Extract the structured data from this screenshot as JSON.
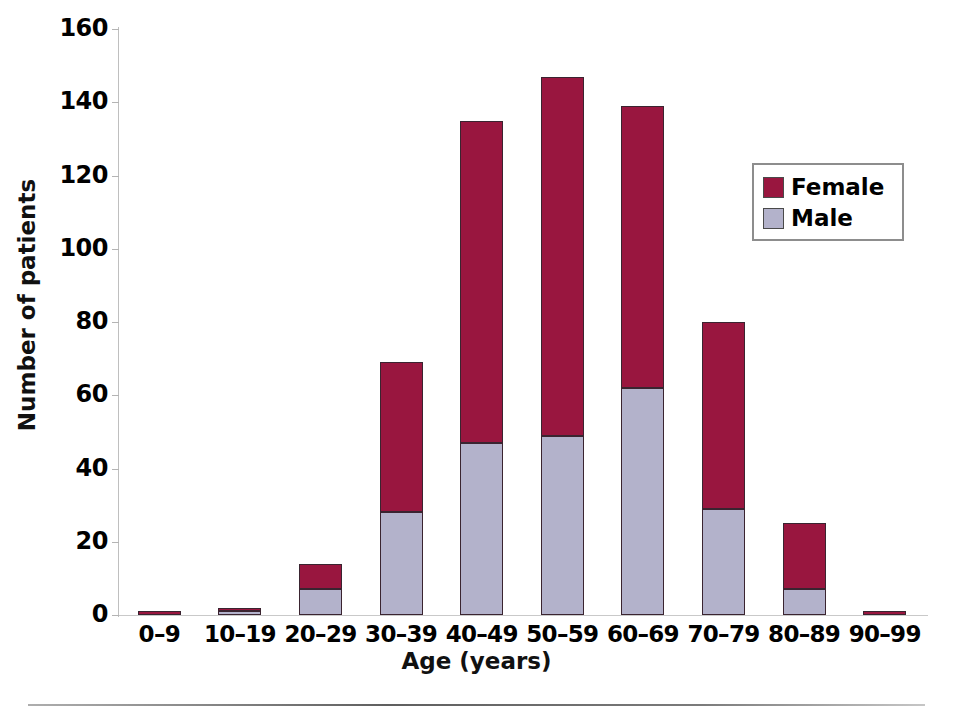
{
  "chart_data": {
    "type": "bar",
    "subtype": "stacked-vertical",
    "title": "",
    "xlabel": "Age (years)",
    "ylabel": "Number of patients",
    "categories": [
      "0–9",
      "10–19",
      "20–29",
      "30–39",
      "40–49",
      "50–59",
      "60–69",
      "70–79",
      "80–89",
      "90–99"
    ],
    "series": [
      {
        "name": "Male",
        "color": "#b3b2cb",
        "values": [
          0,
          1,
          7,
          28,
          47,
          49,
          62,
          29,
          7,
          0
        ]
      },
      {
        "name": "Female",
        "color": "#99163f",
        "values": [
          1,
          1,
          7,
          41,
          88,
          98,
          77,
          51,
          18,
          1
        ]
      }
    ],
    "totals": [
      1,
      2,
      14,
      69,
      135,
      147,
      139,
      80,
      25,
      1
    ],
    "ylim": [
      0,
      160
    ],
    "yticks": [
      0,
      20,
      40,
      60,
      80,
      100,
      120,
      140,
      160
    ],
    "ytick_labels": [
      "0",
      "20",
      "40",
      "60",
      "80",
      "100",
      "120",
      "140",
      "160"
    ],
    "grid": false,
    "legend_position": "upper right",
    "stack_order": [
      "Male",
      "Female"
    ]
  },
  "legend": {
    "items": [
      {
        "label": "Female",
        "color": "#99163f"
      },
      {
        "label": "Male",
        "color": "#b3b2cb"
      }
    ]
  },
  "footer": {
    "caption_fragment": ""
  }
}
